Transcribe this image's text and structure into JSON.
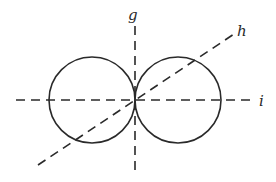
{
  "diagram": {
    "stroke_color": "#2a2a2a",
    "background": "#ffffff",
    "center": {
      "x": 135,
      "y": 100
    },
    "circles": [
      {
        "name": "left-circle",
        "cx": 92,
        "cy": 100,
        "r": 43
      },
      {
        "name": "right-circle",
        "cx": 178,
        "cy": 100,
        "r": 43
      }
    ],
    "axes": [
      {
        "name": "g",
        "label": "g",
        "x1": 135,
        "y1": 24,
        "x2": 135,
        "y2": 174,
        "label_x": 128,
        "label_y": 20
      },
      {
        "name": "h",
        "label": "h",
        "x1": 38,
        "y1": 165,
        "x2": 234,
        "y2": 34,
        "label_x": 237,
        "label_y": 35
      },
      {
        "name": "i",
        "label": "i",
        "x1": 16,
        "y1": 100,
        "x2": 254,
        "y2": 100,
        "label_x": 259,
        "label_y": 106
      }
    ]
  }
}
